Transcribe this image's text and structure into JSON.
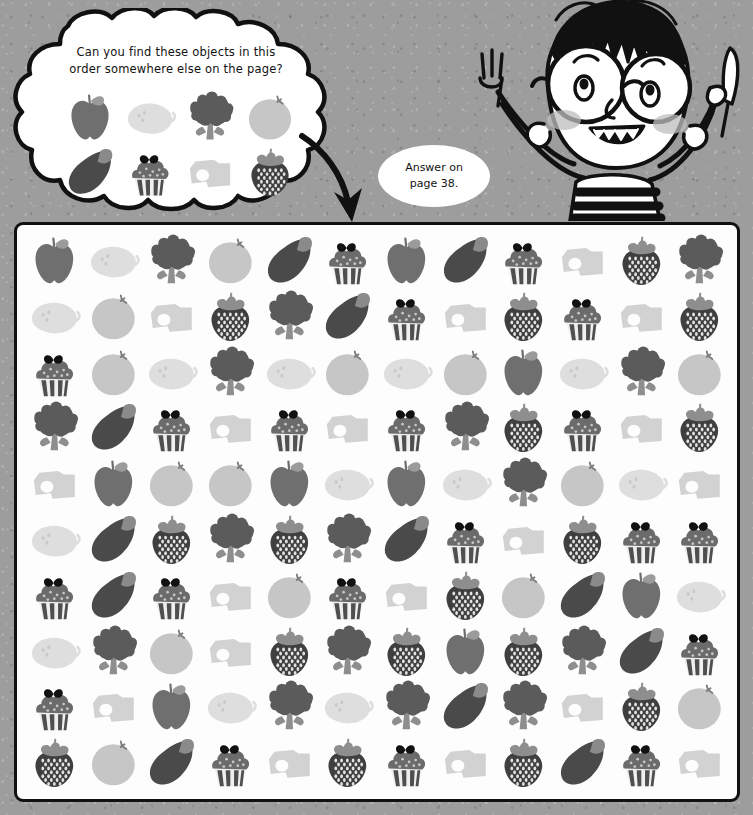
{
  "page": {
    "background_color": "#9c9c9c",
    "panel_background": "#fdfdfd",
    "ink_color": "#111111"
  },
  "clue_bubble": {
    "line1": "Can you find these objects in this",
    "line2": "order somewhere else on the page?",
    "sequence": [
      "apple",
      "lemon",
      "broccoli",
      "orange",
      "eggplant",
      "cupcake",
      "cheese",
      "strawberry"
    ]
  },
  "answer_bubble": {
    "line1": "Answer on",
    "line2": "page 38."
  },
  "character": {
    "name": "boy-with-fork-and-knife",
    "left_hand_item": "fork",
    "right_hand_item": "knife"
  },
  "icon_colors": {
    "apple": "#6f6f6f",
    "lemon": "#dedede",
    "broccoli": "#5b5b5b",
    "orange": "#c6c6c6",
    "eggplant": "#4a4a4a",
    "cupcake": "#6b6b6b",
    "cheese": "#d2d2d2",
    "strawberry": "#3f3f3f"
  },
  "puzzle_grid": {
    "columns": 12,
    "rows": 10,
    "cells": [
      [
        "apple",
        "lemon",
        "broccoli",
        "orange",
        "eggplant",
        "cupcake",
        "apple",
        "eggplant",
        "cupcake",
        "cheese",
        "strawberry",
        "broccoli"
      ],
      [
        "lemon",
        "orange",
        "cheese",
        "strawberry",
        "broccoli",
        "eggplant",
        "cupcake",
        "cheese",
        "strawberry",
        "cupcake",
        "cheese",
        "strawberry"
      ],
      [
        "cupcake",
        "orange",
        "lemon",
        "broccoli",
        "lemon",
        "orange",
        "lemon",
        "orange",
        "apple",
        "lemon",
        "broccoli",
        "orange"
      ],
      [
        "broccoli",
        "eggplant",
        "cupcake",
        "cheese",
        "cupcake",
        "cheese",
        "cupcake",
        "broccoli",
        "strawberry",
        "cupcake",
        "cheese",
        "strawberry"
      ],
      [
        "cheese",
        "apple",
        "orange",
        "orange",
        "apple",
        "lemon",
        "apple",
        "lemon",
        "broccoli",
        "orange",
        "lemon",
        "cheese"
      ],
      [
        "lemon",
        "eggplant",
        "strawberry",
        "broccoli",
        "strawberry",
        "broccoli",
        "eggplant",
        "cupcake",
        "cheese",
        "strawberry",
        "cupcake",
        "cupcake"
      ],
      [
        "cupcake",
        "eggplant",
        "cupcake",
        "cheese",
        "orange",
        "cupcake",
        "cheese",
        "strawberry",
        "orange",
        "eggplant",
        "apple",
        "lemon"
      ],
      [
        "lemon",
        "broccoli",
        "orange",
        "cheese",
        "strawberry",
        "broccoli",
        "strawberry",
        "apple",
        "strawberry",
        "broccoli",
        "eggplant",
        "cupcake"
      ],
      [
        "cupcake",
        "cheese",
        "apple",
        "lemon",
        "broccoli",
        "lemon",
        "broccoli",
        "eggplant",
        "broccoli",
        "cheese",
        "strawberry",
        "orange"
      ],
      [
        "strawberry",
        "orange",
        "eggplant",
        "cupcake",
        "cheese",
        "strawberry",
        "cupcake",
        "cheese",
        "strawberry",
        "eggplant",
        "cupcake",
        "cheese"
      ]
    ]
  }
}
